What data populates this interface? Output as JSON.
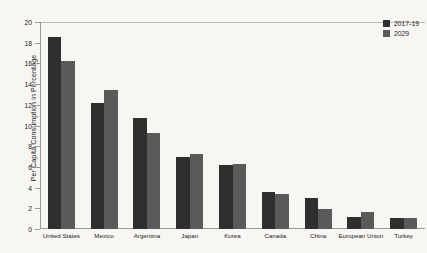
{
  "chart_data": {
    "type": "bar",
    "title": "",
    "xlabel": "",
    "ylabel": "Per Capita Consumption in Percentage",
    "ylim": [
      0,
      20
    ],
    "ytick_step": 2,
    "yticks": [
      0,
      2,
      4,
      6,
      8,
      10,
      12,
      14,
      16,
      18,
      20
    ],
    "grid": false,
    "legend_position": "top-right",
    "categories": [
      "United States",
      "Mexico",
      "Argentina",
      "Japan",
      "Korea",
      "Canada",
      "China",
      "European Union",
      "Turkey"
    ],
    "series": [
      {
        "name": "2017-19",
        "color": "#2f2f2f",
        "values": [
          18.6,
          12.2,
          10.7,
          7.0,
          6.2,
          3.6,
          3.0,
          1.2,
          1.1
        ]
      },
      {
        "name": "2029",
        "color": "#5a5a5a",
        "values": [
          16.2,
          13.4,
          9.3,
          7.2,
          6.3,
          3.4,
          1.9,
          1.6,
          1.1
        ]
      }
    ]
  },
  "colors": {
    "background": "#f7f6f3",
    "axis": "#9a9a9a",
    "text": "#1c1c1c",
    "series_2017_19": "#2f2f2f",
    "series_2029": "#5a5a5a"
  }
}
